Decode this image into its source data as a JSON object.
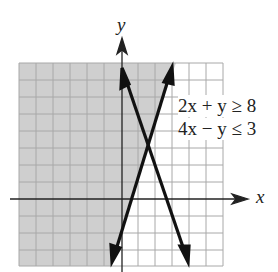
{
  "figure": {
    "axis_x_label": "x",
    "axis_y_label": "y",
    "inequality_1": "2x + y ≥ 8",
    "inequality_2": "4x − y ≤ 3",
    "grid": {
      "columns": 12,
      "rows": 12
    },
    "shaded_region": "left of line 4x − y = 3 and below line 2x + y = 8 boundary (feasible shaded area)",
    "colors": {
      "shade": "#cfcfcf",
      "grid": "#a8a8a8",
      "lines": "#111111"
    }
  }
}
